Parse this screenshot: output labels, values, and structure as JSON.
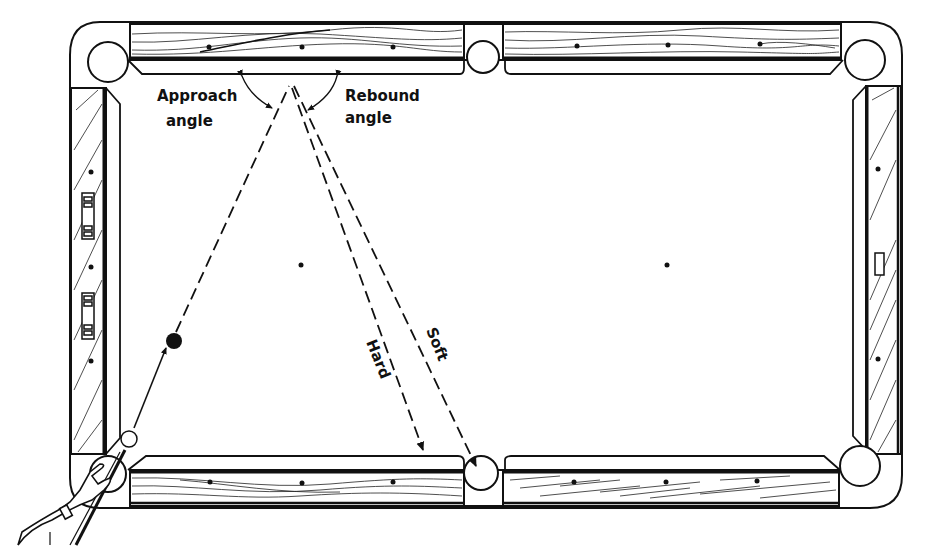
{
  "diagram": {
    "labels": {
      "approach_line1": "Approach",
      "approach_line2": "angle",
      "rebound_line1": "Rebound",
      "rebound_line2": "angle",
      "hard": "Hard",
      "soft": "Soft"
    },
    "colors": {
      "ink": "#111111",
      "paper": "#ffffff"
    },
    "pockets": [
      "top-left",
      "top-middle",
      "top-right",
      "bottom-left",
      "bottom-middle",
      "bottom-right"
    ],
    "balls": [
      "cue-ball",
      "object-ball"
    ],
    "paths": [
      "cue-ball-to-object-ball",
      "approach-path",
      "rebound-hard",
      "rebound-soft"
    ]
  }
}
